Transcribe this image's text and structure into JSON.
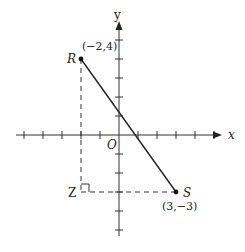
{
  "figure": {
    "origin_px": [
      119,
      135
    ],
    "unit_px": 19,
    "axes": {
      "x_label": "x",
      "y_label": "y",
      "origin_label": "O",
      "x_ticks": [
        -5,
        -4,
        -3,
        -2,
        -1,
        1,
        2,
        3,
        4,
        5
      ],
      "y_ticks": [
        -5,
        -4,
        -3,
        -2,
        -1,
        1,
        2,
        3,
        4,
        5
      ]
    },
    "points": {
      "R": {
        "label": "R",
        "coord_label": "(−2,4)",
        "x": -2,
        "y": 4
      },
      "S": {
        "label": "S",
        "coord_label": "(3,−3)",
        "x": 3,
        "y": -3
      },
      "Z": {
        "label": "Z",
        "x": -2,
        "y": -3
      }
    },
    "segments": [
      {
        "name": "RS",
        "from": "R",
        "to": "S",
        "style": "solid"
      },
      {
        "name": "RZ",
        "from": "R",
        "to": "Z",
        "style": "dashed"
      },
      {
        "name": "ZS",
        "from": "Z",
        "to": "S",
        "style": "dashed"
      }
    ],
    "right_angle_at": "Z",
    "colors": {
      "ink": "#222222",
      "background": "#ffffff"
    }
  }
}
